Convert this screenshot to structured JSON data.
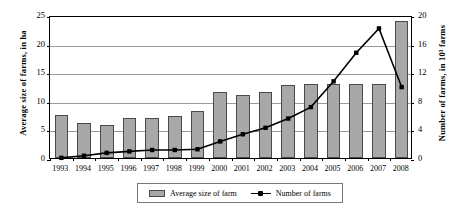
{
  "chart_data": {
    "type": "bar",
    "title": "",
    "xlabel": "",
    "ylabel": "Average size of farms, in ha",
    "y2label": "Number of farms, in 10³ farms",
    "grid": true,
    "legend_position": "bottom",
    "categories": [
      "1993",
      "1994",
      "1995",
      "1996",
      "1997",
      "1998",
      "1999",
      "2000",
      "2001",
      "2002",
      "2003",
      "2004",
      "2005",
      "2006",
      "2007",
      "2008"
    ],
    "ylim": [
      0,
      25
    ],
    "yticks": [
      "0",
      "5",
      "10",
      "15",
      "20",
      "25"
    ],
    "ytick_values": [
      0,
      5,
      10,
      15,
      20,
      25
    ],
    "y2lim": [
      0,
      20
    ],
    "y2ticks": [
      "0",
      "4",
      "8",
      "12",
      "16",
      "20"
    ],
    "y2tick_values": [
      0,
      4,
      8,
      12,
      16,
      20
    ],
    "series": [
      {
        "name": "Average size of farm",
        "type": "bar",
        "axis": "left",
        "color": "#a8a8a8",
        "edge_color": "#4a4a4a",
        "values": [
          7.6,
          6.1,
          5.7,
          7.0,
          7.0,
          7.3,
          8.2,
          11.6,
          11.1,
          11.5,
          12.8,
          12.9,
          13.0,
          13.0,
          13.0,
          24.0
        ]
      },
      {
        "name": "Number of farms",
        "type": "line",
        "axis": "right",
        "color": "#000000",
        "marker": "square",
        "values": [
          0.3,
          0.6,
          1.0,
          1.2,
          1.4,
          1.4,
          1.5,
          2.6,
          3.6,
          4.5,
          5.8,
          7.4,
          11.0,
          15.0,
          18.4,
          18.5
        ]
      }
    ],
    "line_display_values": [
      0.3,
      0.6,
      1.0,
      1.2,
      1.4,
      1.4,
      1.5,
      2.6,
      3.6,
      4.5,
      5.8,
      7.4,
      11.0,
      15.0,
      18.4,
      10.2
    ]
  },
  "legend": {
    "items": [
      {
        "label": "Average size of farm",
        "marker": "bar-swatch"
      },
      {
        "label": "Number of farms",
        "marker": "line-swatch"
      }
    ]
  }
}
